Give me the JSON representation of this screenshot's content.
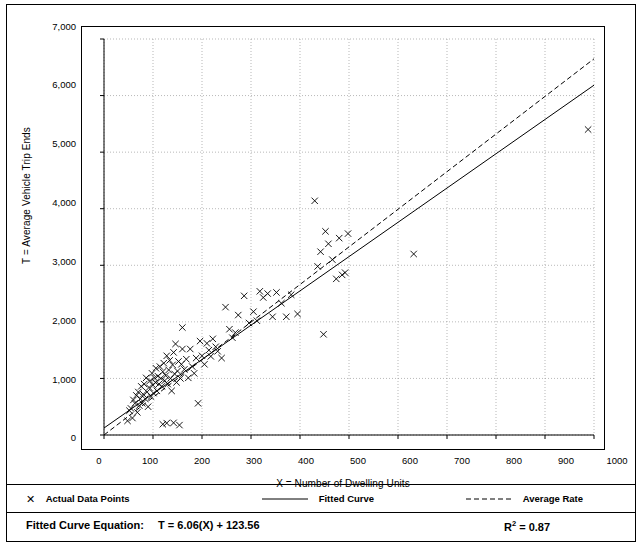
{
  "chart_data": {
    "type": "scatter",
    "title": "",
    "xlabel": "X = Number of Dwelling Units",
    "ylabel": "T = Average Vehicle Trip Ends",
    "xlim": [
      0,
      1000
    ],
    "ylim": [
      0,
      7000
    ],
    "xticks": [
      0,
      100,
      200,
      300,
      400,
      500,
      600,
      700,
      800,
      900,
      1000
    ],
    "xtick_labels": [
      "0",
      "100",
      "200",
      "300",
      "400",
      "500",
      "600",
      "700",
      "800",
      "900",
      "1000"
    ],
    "yticks": [
      0,
      1000,
      2000,
      3000,
      4000,
      5000,
      6000,
      7000
    ],
    "ytick_labels": [
      "0",
      "1,000",
      "2,000",
      "3,000",
      "4,000",
      "5,000",
      "6,000",
      "7,000"
    ],
    "grid": true,
    "grid_style": "dotted",
    "marker": "x",
    "marker_color": "#000000",
    "series": [
      {
        "name": "Actual Data Points",
        "type": "scatter",
        "points": [
          [
            48,
            250
          ],
          [
            52,
            430
          ],
          [
            55,
            470
          ],
          [
            58,
            300
          ],
          [
            60,
            620
          ],
          [
            63,
            560
          ],
          [
            66,
            700
          ],
          [
            68,
            400
          ],
          [
            70,
            760
          ],
          [
            72,
            520
          ],
          [
            74,
            640
          ],
          [
            76,
            860
          ],
          [
            78,
            560
          ],
          [
            80,
            720
          ],
          [
            82,
            900
          ],
          [
            84,
            640
          ],
          [
            86,
            1010
          ],
          [
            88,
            760
          ],
          [
            90,
            500
          ],
          [
            92,
            840
          ],
          [
            94,
            960
          ],
          [
            96,
            680
          ],
          [
            98,
            1090
          ],
          [
            100,
            880
          ],
          [
            101,
            740
          ],
          [
            103,
            1010
          ],
          [
            105,
            930
          ],
          [
            106,
            1180
          ],
          [
            108,
            780
          ],
          [
            110,
            1040
          ],
          [
            112,
            900
          ],
          [
            114,
            1210
          ],
          [
            116,
            1000
          ],
          [
            118,
            860
          ],
          [
            120,
            1120
          ],
          [
            122,
            1270
          ],
          [
            124,
            960
          ],
          [
            126,
            1050
          ],
          [
            128,
            1400
          ],
          [
            130,
            900
          ],
          [
            132,
            1150
          ],
          [
            134,
            1320
          ],
          [
            136,
            1000
          ],
          [
            138,
            780
          ],
          [
            140,
            1240
          ],
          [
            142,
            1460
          ],
          [
            144,
            1080
          ],
          [
            146,
            1610
          ],
          [
            148,
            930
          ],
          [
            150,
            1130
          ],
          [
            152,
            1300
          ],
          [
            154,
            175
          ],
          [
            156,
            1000
          ],
          [
            158,
            1250
          ],
          [
            160,
            1520
          ],
          [
            120,
            190
          ],
          [
            128,
            210
          ],
          [
            142,
            215
          ],
          [
            160,
            1900
          ],
          [
            164,
            1160
          ],
          [
            168,
            1340
          ],
          [
            172,
            1010
          ],
          [
            176,
            1520
          ],
          [
            180,
            1210
          ],
          [
            184,
            1090
          ],
          [
            188,
            1360
          ],
          [
            192,
            560
          ],
          [
            196,
            1660
          ],
          [
            200,
            1400
          ],
          [
            205,
            1250
          ],
          [
            210,
            1620
          ],
          [
            214,
            1500
          ],
          [
            218,
            1390
          ],
          [
            222,
            1700
          ],
          [
            228,
            1560
          ],
          [
            232,
            1480
          ],
          [
            240,
            1360
          ],
          [
            248,
            2260
          ],
          [
            256,
            1870
          ],
          [
            262,
            1720
          ],
          [
            268,
            1810
          ],
          [
            274,
            2120
          ],
          [
            286,
            2460
          ],
          [
            296,
            1980
          ],
          [
            305,
            2180
          ],
          [
            312,
            2020
          ],
          [
            318,
            2540
          ],
          [
            325,
            2430
          ],
          [
            334,
            2500
          ],
          [
            344,
            2090
          ],
          [
            352,
            2520
          ],
          [
            362,
            2330
          ],
          [
            372,
            2090
          ],
          [
            382,
            2480
          ],
          [
            395,
            2140
          ],
          [
            430,
            4140
          ],
          [
            436,
            2980
          ],
          [
            442,
            3240
          ],
          [
            448,
            1780
          ],
          [
            452,
            3600
          ],
          [
            458,
            3380
          ],
          [
            466,
            3100
          ],
          [
            474,
            2760
          ],
          [
            480,
            3480
          ],
          [
            486,
            2830
          ],
          [
            492,
            2870
          ],
          [
            498,
            3560
          ],
          [
            632,
            3200
          ],
          [
            988,
            5400
          ]
        ]
      }
    ],
    "lines": [
      {
        "name": "Fitted Curve",
        "style": "solid",
        "color": "#000000",
        "equation": "T = 6.06(X) + 123.56",
        "slope": 6.06,
        "intercept": 123.56,
        "x_from": 0,
        "x_to": 1000
      },
      {
        "name": "Average Rate",
        "style": "dashed",
        "color": "#000000",
        "slope": 6.65,
        "intercept": 0,
        "x_from": 0,
        "x_to": 1000
      }
    ],
    "legend": {
      "position": "bottom",
      "entries": [
        {
          "label": "Actual Data Points",
          "marker": "x-marker"
        },
        {
          "label": "Fitted Curve",
          "marker": "solid-line"
        },
        {
          "label": "Average Rate",
          "marker": "dashed-line"
        }
      ]
    },
    "footer": {
      "equation_label": "Fitted Curve Equation:",
      "equation_value": "T = 6.06(X) + 123.56",
      "r2_label": "R",
      "r2_sup": "2",
      "r2_value": " = 0.87"
    }
  }
}
